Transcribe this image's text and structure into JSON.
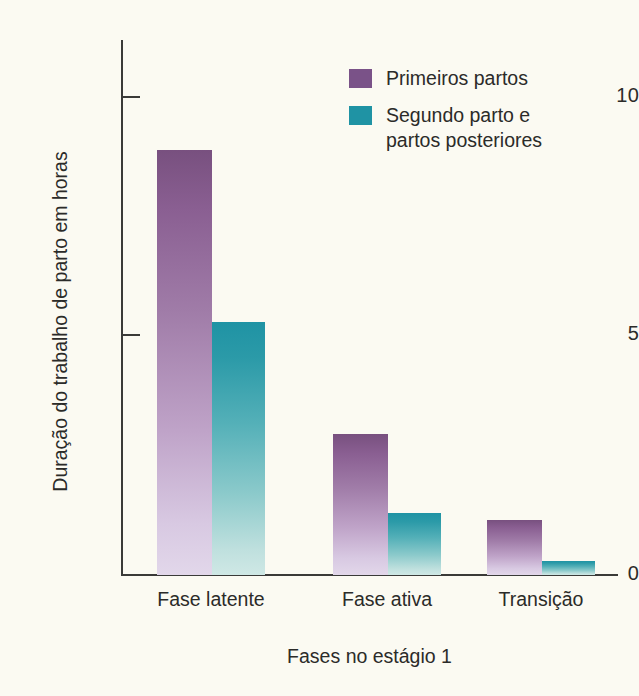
{
  "chart_data": {
    "type": "bar",
    "title": "",
    "xlabel": "Fases no estágio 1",
    "ylabel": "Duração do trabalho de parto em horas",
    "categories": [
      "Fase latente",
      "Fase ativa",
      "Transição"
    ],
    "series": [
      {
        "name": "Primeiros partos",
        "color": "#7a5288",
        "values": [
          8.9,
          2.95,
          1.15
        ]
      },
      {
        "name": "Segundo parto e\npartos posteriores",
        "color": "#1f93a4",
        "values": [
          5.3,
          1.3,
          0.3
        ]
      }
    ],
    "ylim": [
      0,
      10.8
    ],
    "yticks": [
      0,
      5,
      10
    ],
    "ytick_labels": [
      "0",
      "5",
      "10"
    ],
    "grid": false,
    "legend_position": "top-right",
    "background_color": "#fbfaf2",
    "axis_color": "#3a3a38"
  },
  "legend": {
    "items": [
      {
        "label": "Primeiros partos"
      },
      {
        "label": "Segundo parto e\npartos posteriores"
      }
    ]
  },
  "axes": {
    "y_title": "Duração do trabalho de parto em horas",
    "x_title": "Fases no estágio 1",
    "ytick_0": "0",
    "ytick_5": "5",
    "ytick_10": "10"
  },
  "categories": {
    "c0": "Fase latente",
    "c1": "Fase ativa",
    "c2": "Transição"
  }
}
